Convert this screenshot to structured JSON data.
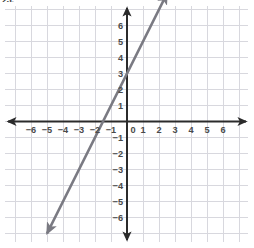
{
  "corner_label": "23.",
  "chart_data": {
    "type": "line",
    "title": "",
    "xlabel": "",
    "ylabel": "",
    "xlim": [
      -7.0,
      7.5
    ],
    "ylim": [
      -7.5,
      7.3
    ],
    "grid": true,
    "grid_spacing": 1,
    "legend": "none",
    "axis_color": "#2b2b2b",
    "grid_color": "#d8d8de",
    "line_color": "#7a7a82",
    "background_color": "#ffffff",
    "x_ticks": [
      -6,
      -5,
      -4,
      -3,
      -2,
      -1,
      0,
      1,
      2,
      3,
      4,
      5,
      6
    ],
    "x_tick_labels": [
      "−6",
      "−5",
      "−4",
      "−3",
      "−2",
      "−1",
      "0",
      "1",
      "2",
      "3",
      "4",
      "5",
      "6"
    ],
    "y_ticks": [
      -6,
      -5,
      -4,
      -3,
      -2,
      -1,
      1,
      2,
      3,
      4,
      5,
      6
    ],
    "y_tick_labels": [
      "−6",
      "−5",
      "−4",
      "−3",
      "−2",
      "−1",
      "1",
      "2",
      "3",
      "4",
      "5",
      "6"
    ],
    "series": [
      {
        "name": "y = 2x + 3",
        "equation": "y = 2x + 3",
        "slope": 2,
        "y_intercept": 3,
        "x_intercept": -1.5,
        "arrow_start": true,
        "arrow_end": true,
        "x": [
          -5.0,
          2.5
        ],
        "values": [
          -7.0,
          8.0
        ],
        "points": [
          {
            "x": -5.0,
            "y": -7.0
          },
          {
            "x": -1.5,
            "y": 0.0
          },
          {
            "x": 0.0,
            "y": 3.0
          },
          {
            "x": 2.5,
            "y": 8.0
          }
        ]
      }
    ]
  }
}
